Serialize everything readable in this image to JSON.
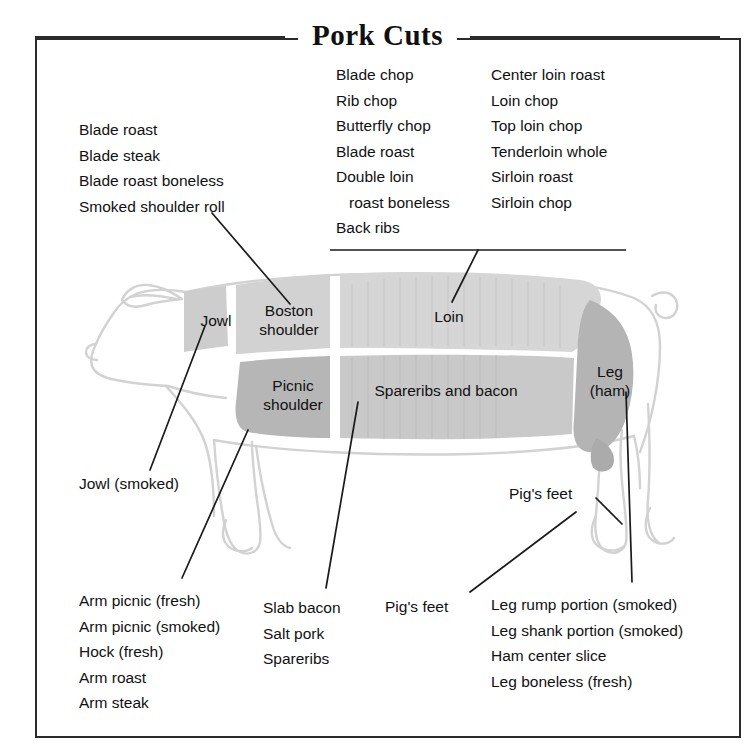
{
  "title": "Pork Cuts",
  "colors": {
    "frame": "#2b2b2b",
    "text": "#111111",
    "outline": "#cfcfcf",
    "shade_light": "#d9d9d9",
    "shade_mid": "#c4c4c4",
    "shade_dark": "#b0b0b0",
    "leader": "#1a1a1a"
  },
  "lists": {
    "loin_column_1": [
      "Blade chop",
      "Rib chop",
      "Butterfly chop",
      "Blade roast",
      "Double loin",
      "roast boneless",
      "Back ribs"
    ],
    "loin_column_2": [
      "Center loin roast",
      "Loin chop",
      "Top loin chop",
      "Tenderloin whole",
      "Sirloin roast",
      "Sirloin chop"
    ],
    "shoulder": [
      "Blade roast",
      "Blade steak",
      "Blade roast boneless",
      "Smoked shoulder roll"
    ],
    "arm": [
      "Arm picnic (fresh)",
      "Arm picnic (smoked)",
      "Hock (fresh)",
      "Arm roast",
      "Arm steak"
    ],
    "bacon": [
      "Slab bacon",
      "Salt pork",
      "Spareribs"
    ],
    "leg": [
      "Leg rump portion (smoked)",
      "Leg shank portion (smoked)",
      "Ham center slice",
      "Leg boneless (fresh)"
    ]
  },
  "callouts": {
    "jowl_smoked": "Jowl (smoked)",
    "pigs_feet_rear": "Pig's feet",
    "pigs_feet_front": "Pig's feet"
  },
  "regions": {
    "jowl": "Jowl",
    "boston_shoulder_line1": "Boston",
    "boston_shoulder_line2": "shoulder",
    "loin": "Loin",
    "picnic_shoulder_line1": "Picnic",
    "picnic_shoulder_line2": "shoulder",
    "spareribs_bacon": "Spareribs and bacon",
    "leg_line1": "Leg",
    "leg_line2": "(ham)"
  }
}
